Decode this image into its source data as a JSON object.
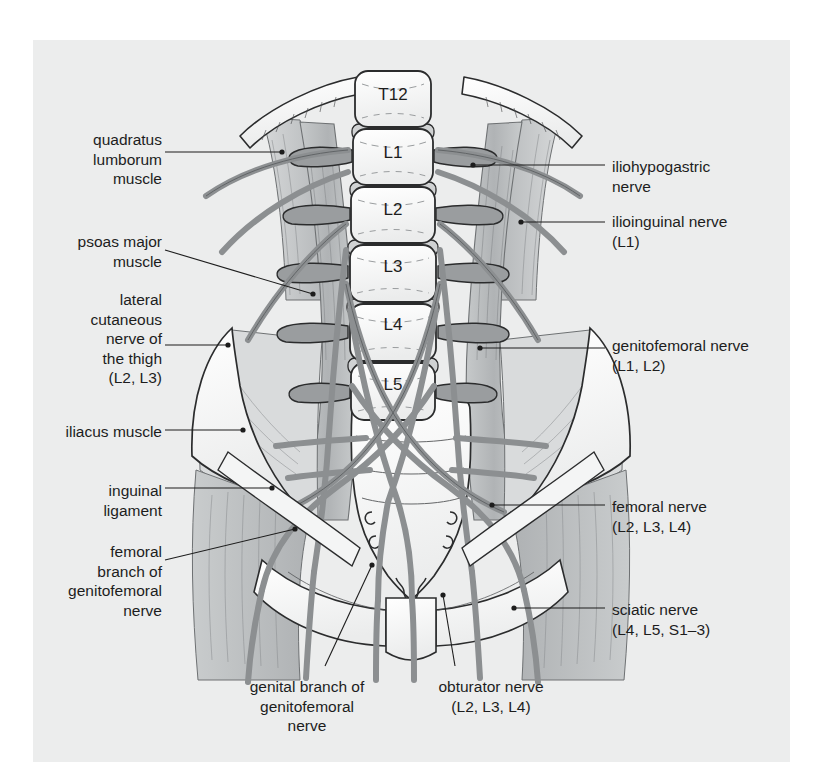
{
  "figure": {
    "background_color": "#ffffff",
    "panel_color": "#eceded",
    "line_color": "#1d1d1d",
    "nerve_color": "#8c8f91",
    "muscle_color": "#b9bcbd",
    "bone_color": "#fbfbfb"
  },
  "vertebrae": [
    {
      "label": "T12",
      "cx": 393,
      "cy": 100
    },
    {
      "label": "L1",
      "cx": 393,
      "cy": 158
    },
    {
      "label": "L2",
      "cx": 393,
      "cy": 215
    },
    {
      "label": "L3",
      "cx": 393,
      "cy": 272
    },
    {
      "label": "L4",
      "cx": 393,
      "cy": 330
    },
    {
      "label": "L5",
      "cx": 393,
      "cy": 390
    }
  ],
  "labels_left": [
    {
      "name": "quadratus-lumborum-muscle",
      "text": "quadratus\nlumborum\nmuscle",
      "x": 12,
      "y": 130,
      "w": 150,
      "align": "right"
    },
    {
      "name": "psoas-major-muscle",
      "text": "psoas major\nmuscle",
      "x": 12,
      "y": 232,
      "w": 150,
      "align": "right"
    },
    {
      "name": "lateral-cutaneous-nerve-of-the-thigh",
      "text": "lateral\ncutaneous\nnerve of\nthe thigh\n(L2, L3)",
      "x": 12,
      "y": 290,
      "w": 150,
      "align": "right"
    },
    {
      "name": "iliacus-muscle",
      "text": "iliacus muscle",
      "x": 12,
      "y": 422,
      "w": 150,
      "align": "right"
    },
    {
      "name": "inguinal-ligament",
      "text": "inguinal\nligament",
      "x": 12,
      "y": 481,
      "w": 150,
      "align": "right"
    },
    {
      "name": "femoral-branch-of-genitofemoral-nerve",
      "text": "femoral\nbranch of\ngenitofemoral\nnerve",
      "x": 4,
      "y": 542,
      "w": 158,
      "align": "right"
    }
  ],
  "labels_right": [
    {
      "name": "iliohypogastric-nerve",
      "text": "iliohypogastric\nnerve",
      "x": 612,
      "y": 157,
      "w": 200,
      "align": "left"
    },
    {
      "name": "ilioinguinal-nerve",
      "text": "ilioinguinal nerve\n(L1)",
      "x": 612,
      "y": 212,
      "w": 200,
      "align": "left"
    },
    {
      "name": "genitofemoral-nerve",
      "text": "genitofemoral nerve\n(L1, L2)",
      "x": 612,
      "y": 336,
      "w": 206,
      "align": "left"
    },
    {
      "name": "femoral-nerve",
      "text": "femoral nerve\n(L2, L3, L4)",
      "x": 612,
      "y": 497,
      "w": 200,
      "align": "left"
    },
    {
      "name": "sciatic-nerve",
      "text": "sciatic nerve\n(L4, L5, S1–3)",
      "x": 612,
      "y": 600,
      "w": 200,
      "align": "left"
    }
  ],
  "labels_bottom": [
    {
      "name": "genital-branch-of-genitofemoral-nerve",
      "text": "genital branch of\ngenitofemoral\nnerve",
      "x": 212,
      "y": 677,
      "w": 190,
      "align": "center"
    },
    {
      "name": "obturator-nerve",
      "text": "obturator nerve\n(L2, L3, L4)",
      "x": 406,
      "y": 677,
      "w": 170,
      "align": "center"
    }
  ],
  "leaders_left": [
    {
      "name": "leader-quadratus-lumborum",
      "x1": 165,
      "y1": 152,
      "x2": 282,
      "y2": 152
    },
    {
      "name": "leader-psoas-major",
      "x1": 165,
      "y1": 250,
      "x2": 313,
      "y2": 294
    },
    {
      "name": "leader-lateral-cutaneous-nerve",
      "x1": 165,
      "y1": 345,
      "x2": 228,
      "y2": 345
    },
    {
      "name": "leader-iliacus-muscle",
      "x1": 165,
      "y1": 430,
      "x2": 243,
      "y2": 430
    },
    {
      "name": "leader-inguinal-ligament",
      "x1": 165,
      "y1": 488,
      "x2": 272,
      "y2": 488
    },
    {
      "name": "leader-femoral-branch",
      "x1": 165,
      "y1": 560,
      "x2": 295,
      "y2": 529
    }
  ],
  "leaders_right": [
    {
      "name": "leader-iliohypogastric",
      "x1": 605,
      "y1": 165,
      "x2": 473,
      "y2": 165
    },
    {
      "name": "leader-ilioinguinal",
      "x1": 605,
      "y1": 222,
      "x2": 521,
      "y2": 222
    },
    {
      "name": "leader-genitofemoral",
      "x1": 605,
      "y1": 348,
      "x2": 480,
      "y2": 348
    },
    {
      "name": "leader-femoral-nerve",
      "x1": 605,
      "y1": 505,
      "x2": 492,
      "y2": 505
    },
    {
      "name": "leader-sciatic-nerve",
      "x1": 605,
      "y1": 608,
      "x2": 514,
      "y2": 608
    }
  ],
  "leaders_bottom": [
    {
      "name": "leader-genital-branch",
      "x1": 325,
      "y1": 666,
      "x2": 372,
      "y2": 565
    },
    {
      "name": "leader-obturator-nerve",
      "x1": 455,
      "y1": 666,
      "x2": 443,
      "y2": 595
    }
  ]
}
